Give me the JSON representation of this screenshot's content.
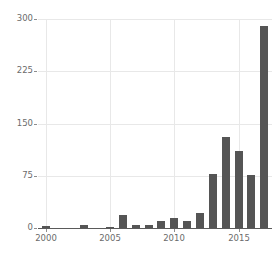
{
  "chart_data": {
    "type": "bar",
    "title": "",
    "subtitle": "",
    "xlabel": "",
    "ylabel": "",
    "categories": [
      2000,
      2001,
      2002,
      2003,
      2004,
      2005,
      2006,
      2007,
      2008,
      2009,
      2010,
      2011,
      2012,
      2013,
      2014,
      2015,
      2016,
      2017
    ],
    "values": [
      3,
      0,
      0,
      4,
      0,
      2,
      18,
      5,
      5,
      10,
      14,
      10,
      22,
      78,
      130,
      110,
      76,
      290
    ],
    "series": [
      {
        "name": "count",
        "values": [
          3,
          0,
          0,
          4,
          0,
          2,
          18,
          5,
          5,
          10,
          14,
          10,
          22,
          78,
          130,
          110,
          76,
          290
        ]
      }
    ],
    "ylim": [
      0,
      300
    ],
    "xlim": [
      1999.4,
      2017.6
    ],
    "yticks": [
      0,
      75,
      150,
      225,
      300
    ],
    "ytick_labels": [
      "0",
      "75",
      "150",
      "225",
      "300"
    ],
    "xticks": [
      2000,
      2005,
      2010,
      2015
    ],
    "xtick_labels": [
      "2000",
      "2005",
      "2010",
      "2015"
    ],
    "grid": true,
    "grid_axis": "both",
    "legend": false,
    "legend_position": "none",
    "bar_color": "#555555",
    "grid_color": "#e8e8e8",
    "axis_color": "#5a5a5a",
    "tick_label_color": "#6b6b6b",
    "background_color": "#ffffff"
  }
}
